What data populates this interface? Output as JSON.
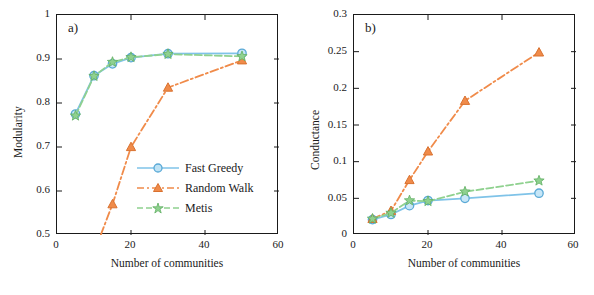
{
  "figure": {
    "panels": [
      {
        "label": "a)",
        "xlabel": "Number of communities",
        "ylabel": "Modularity",
        "xticks": [
          "0",
          "20",
          "40",
          "60"
        ],
        "yticks": [
          "0.5",
          "0.6",
          "0.7",
          "0.8",
          "0.9",
          "1"
        ],
        "legend": [
          {
            "name": "Fast Greedy",
            "color": "#7fc3e8",
            "marker": "circle",
            "dash": "solid"
          },
          {
            "name": "Random Walk",
            "color": "#f08b4a",
            "marker": "triangle",
            "dash": "dashdot"
          },
          {
            "name": "Metis",
            "color": "#8fd18f",
            "marker": "star",
            "dash": "dashed"
          }
        ]
      },
      {
        "label": "b)",
        "xlabel": "Number of communities",
        "ylabel": "Conductance",
        "xticks": [
          "0",
          "20",
          "40",
          "60"
        ],
        "yticks": [
          "0",
          "0.05",
          "0.1",
          "0.15",
          "0.2",
          "0.25",
          "0.3"
        ],
        "legend": []
      }
    ]
  },
  "chart_data": [
    {
      "type": "line",
      "title": "",
      "panel": "a)",
      "xlabel": "Number of communities",
      "ylabel": "Modularity",
      "xlim": [
        0,
        60
      ],
      "ylim": [
        0.5,
        1.0
      ],
      "xticks": [
        0,
        20,
        40,
        60
      ],
      "yticks": [
        0.5,
        0.6,
        0.7,
        0.8,
        0.9,
        1.0
      ],
      "grid": false,
      "legend_position": "lower-right-inside",
      "x": [
        5,
        10,
        15,
        20,
        30,
        50
      ],
      "series": [
        {
          "name": "Fast Greedy",
          "color": "#7fc3e8",
          "marker": "circle",
          "dash": "solid",
          "values": [
            0.775,
            0.862,
            0.889,
            0.903,
            0.912,
            0.913
          ]
        },
        {
          "name": "Random Walk",
          "color": "#f08b4a",
          "marker": "triangle",
          "dash": "dashdot",
          "values": [
            0.41,
            0.46,
            0.57,
            0.7,
            0.835,
            0.897
          ]
        },
        {
          "name": "Metis",
          "color": "#8fd18f",
          "marker": "star",
          "dash": "dashed",
          "values": [
            0.771,
            0.861,
            0.893,
            0.904,
            0.911,
            0.906
          ]
        }
      ]
    },
    {
      "type": "line",
      "title": "",
      "panel": "b)",
      "xlabel": "Number of communities",
      "ylabel": "Conductance",
      "xlim": [
        0,
        60
      ],
      "ylim": [
        0,
        0.3
      ],
      "xticks": [
        0,
        20,
        40,
        60
      ],
      "yticks": [
        0,
        0.05,
        0.1,
        0.15,
        0.2,
        0.25,
        0.3
      ],
      "grid": false,
      "legend_position": "none",
      "x": [
        5,
        10,
        15,
        20,
        30,
        50
      ],
      "series": [
        {
          "name": "Fast Greedy",
          "color": "#7fc3e8",
          "marker": "circle",
          "dash": "solid",
          "values": [
            0.021,
            0.028,
            0.04,
            0.047,
            0.05,
            0.057
          ]
        },
        {
          "name": "Random Walk",
          "color": "#f08b4a",
          "marker": "triangle",
          "dash": "dashdot",
          "values": [
            0.022,
            0.033,
            0.075,
            0.114,
            0.183,
            0.249
          ]
        },
        {
          "name": "Metis",
          "color": "#8fd18f",
          "marker": "star",
          "dash": "dashed",
          "values": [
            0.022,
            0.03,
            0.047,
            0.046,
            0.059,
            0.074
          ]
        }
      ]
    }
  ]
}
